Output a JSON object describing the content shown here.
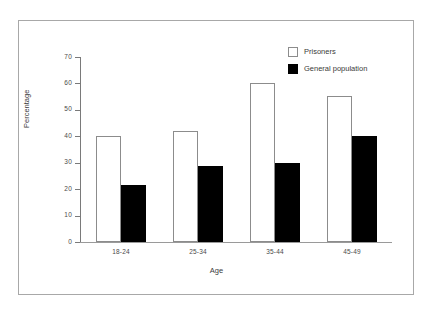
{
  "chart_data": {
    "type": "bar",
    "title": "",
    "xlabel": "Age",
    "ylabel": "Percentage",
    "categories": [
      "18-24",
      "25-34",
      "35-44",
      "45-49"
    ],
    "series": [
      {
        "name": "Prisoners",
        "color": "#ffffff",
        "values": [
          40,
          42,
          60,
          55.3
        ]
      },
      {
        "name": "General population",
        "color": "#000000",
        "values": [
          21.4,
          28.7,
          30,
          40.2
        ]
      }
    ],
    "ylim": [
      0,
      70
    ],
    "yticks": [
      0,
      10,
      20,
      30,
      40,
      50,
      60,
      70
    ],
    "grid": false,
    "legend_position": "top-right"
  },
  "legend": {
    "items": [
      {
        "label": "Prisoners"
      },
      {
        "label": "General population"
      }
    ]
  }
}
